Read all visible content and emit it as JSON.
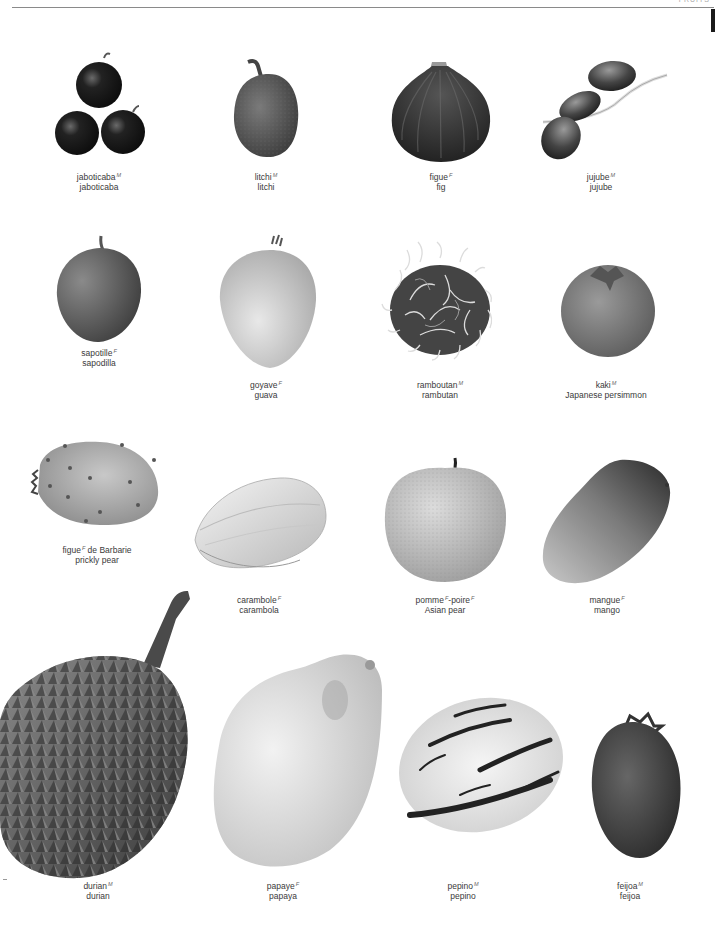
{
  "page": {
    "header_text": "FRUITS",
    "background": "#ffffff",
    "rule_color": "#8a8a8a",
    "tab_color": "#1a1a1a"
  },
  "fruits": [
    {
      "id": "jaboticaba",
      "fr": "jaboticaba",
      "gender": "M",
      "fr_suffix": "",
      "en": "jaboticaba",
      "caption_x": 99,
      "caption_y": 172
    },
    {
      "id": "litchi",
      "fr": "litchi",
      "gender": "M",
      "fr_suffix": "",
      "en": "litchi",
      "caption_x": 266,
      "caption_y": 172
    },
    {
      "id": "fig",
      "fr": "figue",
      "gender": "F",
      "fr_suffix": "",
      "en": "fig",
      "caption_x": 441,
      "caption_y": 172
    },
    {
      "id": "jujube",
      "fr": "jujube",
      "gender": "M",
      "fr_suffix": "",
      "en": "jujube",
      "caption_x": 601,
      "caption_y": 172
    },
    {
      "id": "sapodilla",
      "fr": "sapotille",
      "gender": "F",
      "fr_suffix": "",
      "en": "sapodilla",
      "caption_x": 99,
      "caption_y": 348
    },
    {
      "id": "guava",
      "fr": "goyave",
      "gender": "F",
      "fr_suffix": "",
      "en": "guava",
      "caption_x": 266,
      "caption_y": 380
    },
    {
      "id": "rambutan",
      "fr": "ramboutan",
      "gender": "M",
      "fr_suffix": "",
      "en": "rambutan",
      "caption_x": 440,
      "caption_y": 380
    },
    {
      "id": "japanese-persimmon",
      "fr": "kaki",
      "gender": "M",
      "fr_suffix": "",
      "en": "Japanese persimmon",
      "caption_x": 606,
      "caption_y": 380
    },
    {
      "id": "prickly-pear",
      "fr": "figue",
      "gender": "F",
      "fr_suffix": " de Barbarie",
      "en": "prickly pear",
      "caption_x": 97,
      "caption_y": 545
    },
    {
      "id": "carambola",
      "fr": "carambole",
      "gender": "F",
      "fr_suffix": "",
      "en": "carambola",
      "caption_x": 259,
      "caption_y": 595
    },
    {
      "id": "asian-pear",
      "fr": "pomme",
      "gender": "F",
      "fr_suffix": "-poire",
      "fr_suffix_gender": "F",
      "en": "Asian pear",
      "caption_x": 445,
      "caption_y": 595
    },
    {
      "id": "mango",
      "fr": "mangue",
      "gender": "F",
      "fr_suffix": "",
      "en": "mango",
      "caption_x": 607,
      "caption_y": 595
    },
    {
      "id": "durian",
      "fr": "durian",
      "gender": "M",
      "fr_suffix": "",
      "en": "durian",
      "caption_x": 98,
      "caption_y": 881
    },
    {
      "id": "papaya",
      "fr": "papaye",
      "gender": "F",
      "fr_suffix": "",
      "en": "papaya",
      "caption_x": 283,
      "caption_y": 881
    },
    {
      "id": "pepino",
      "fr": "pepino",
      "gender": "M",
      "fr_suffix": "",
      "en": "pepino",
      "caption_x": 463,
      "caption_y": 881
    },
    {
      "id": "feijoa",
      "fr": "feijoa",
      "gender": "M",
      "fr_suffix": "",
      "en": "feijoa",
      "caption_x": 630,
      "caption_y": 881
    }
  ]
}
